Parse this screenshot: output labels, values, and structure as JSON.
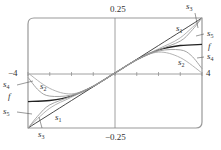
{
  "chart_data": {
    "type": "line",
    "title": "",
    "xlabel": "",
    "ylabel": "",
    "xlim": [
      -4,
      4
    ],
    "ylim": [
      -0.25,
      0.25
    ],
    "grid": false,
    "x_ticks": [
      -4,
      -3,
      -2,
      -1,
      0,
      1,
      2,
      3,
      4
    ],
    "tick_labels": {
      "x_min": "−4",
      "x_max": "4",
      "y_max": "0.25",
      "y_min": "−0.25"
    },
    "series": [
      {
        "name": "f",
        "color": "#222222",
        "x": [
          -4,
          -3,
          -2,
          -1,
          0,
          1,
          2,
          3,
          4
        ],
        "values": [
          -0.13,
          -0.125,
          -0.105,
          -0.06,
          0,
          0.06,
          0.105,
          0.125,
          0.13
        ]
      },
      {
        "name": "s1",
        "color": "#333333",
        "x": [
          -4,
          -2,
          0,
          2,
          4
        ],
        "values": [
          -0.25,
          -0.125,
          0,
          0.125,
          0.25
        ]
      },
      {
        "name": "s2",
        "color": "#aaaaaa",
        "x": [
          -4,
          -3,
          -2,
          -1,
          0,
          1,
          2,
          3,
          4
        ],
        "values": [
          0,
          -0.07,
          -0.095,
          -0.06,
          0,
          0.06,
          0.095,
          0.07,
          0
        ]
      },
      {
        "name": "s3",
        "color": "#aaaaaa",
        "x": [
          -4,
          -3,
          -2,
          -1,
          0,
          1,
          2,
          3,
          4
        ],
        "values": [
          -0.25,
          -0.16,
          -0.11,
          -0.06,
          0,
          0.06,
          0.11,
          0.16,
          0.25
        ]
      },
      {
        "name": "s4",
        "color": "#999999",
        "x": [
          -4,
          -3.5,
          -3,
          -2,
          -1,
          0,
          1,
          2,
          3,
          3.5,
          4
        ],
        "values": [
          -0.02,
          -0.08,
          -0.105,
          -0.1,
          -0.06,
          0,
          0.06,
          0.1,
          0.105,
          0.08,
          0.02
        ]
      },
      {
        "name": "s5",
        "color": "#999999",
        "x": [
          -4,
          -3.5,
          -3,
          -2,
          -1,
          0,
          1,
          2,
          3,
          3.5,
          4
        ],
        "values": [
          -0.25,
          -0.19,
          -0.145,
          -0.105,
          -0.06,
          0,
          0.06,
          0.105,
          0.145,
          0.19,
          0.25
        ]
      }
    ],
    "annotations": [
      "s1",
      "s2",
      "s3",
      "s4",
      "s5",
      "f"
    ]
  },
  "labels": {
    "y_max": "0.25",
    "y_min": "−0.25",
    "x_min": "−4",
    "x_max": "4",
    "s": "s",
    "f": "f",
    "n1": "1",
    "n2": "2",
    "n3": "3",
    "n4": "4",
    "n5": "5"
  }
}
